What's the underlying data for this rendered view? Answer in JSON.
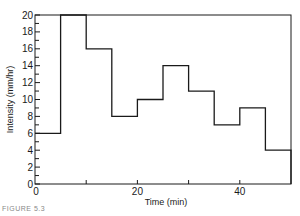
{
  "chart_data": {
    "type": "line",
    "subtype": "step",
    "title": "",
    "xlabel": "Time (min)",
    "ylabel": "Intensity (mm/hr)",
    "xlim": [
      0,
      50
    ],
    "ylim": [
      0,
      20
    ],
    "x_ticks": [
      0,
      10,
      20,
      30,
      40,
      50
    ],
    "x_tick_labels": [
      "0",
      "20",
      "40"
    ],
    "x_tick_label_values": [
      0,
      20,
      40
    ],
    "y_ticks": [
      0,
      1,
      2,
      3,
      4,
      5,
      6,
      7,
      8,
      9,
      10,
      11,
      12,
      13,
      14,
      15,
      16,
      17,
      18,
      19,
      20
    ],
    "y_tick_labels": [
      "0",
      "2",
      "4",
      "6",
      "8",
      "10",
      "12",
      "14",
      "16",
      "18",
      "20"
    ],
    "grid": false,
    "legend": null,
    "series": [
      {
        "name": "Rainfall intensity",
        "intervals": [
          {
            "start": 0,
            "end": 5,
            "value": 6
          },
          {
            "start": 5,
            "end": 10,
            "value": 20
          },
          {
            "start": 10,
            "end": 15,
            "value": 16
          },
          {
            "start": 15,
            "end": 20,
            "value": 8
          },
          {
            "start": 20,
            "end": 25,
            "value": 10
          },
          {
            "start": 25,
            "end": 30,
            "value": 14
          },
          {
            "start": 30,
            "end": 35,
            "value": 11
          },
          {
            "start": 35,
            "end": 40,
            "value": 7
          },
          {
            "start": 40,
            "end": 45,
            "value": 9
          },
          {
            "start": 45,
            "end": 50,
            "value": 4
          }
        ],
        "color": "#1a1a1a"
      }
    ]
  },
  "caption": "FIGURE 5.3"
}
